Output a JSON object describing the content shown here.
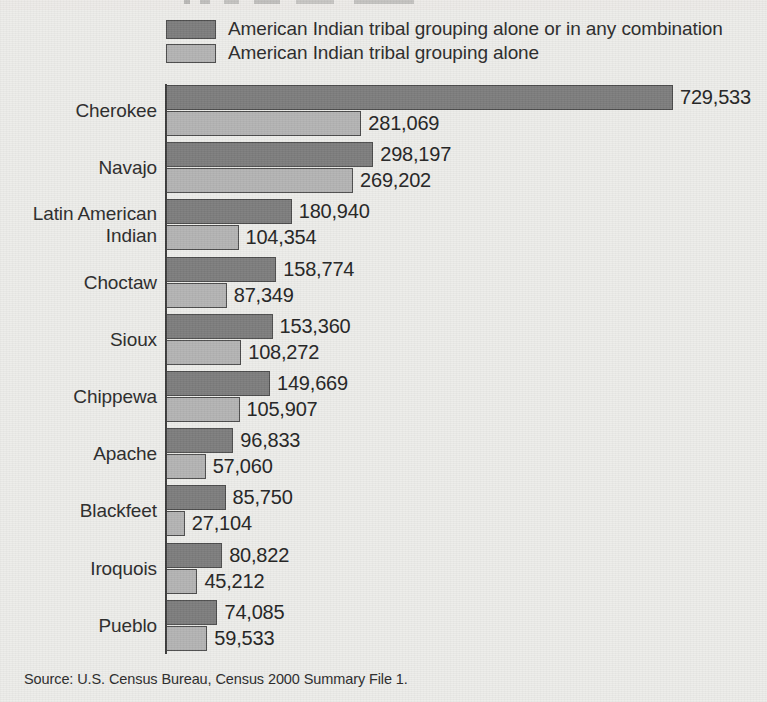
{
  "figure": {
    "background_color": "#ededea",
    "source_note": "Source: U.S. Census Bureau, Census 2000 Summary File 1."
  },
  "legend": {
    "items": [
      {
        "label": "American Indian tribal grouping alone or in any combination",
        "color": "#7d7d7d",
        "key": "combination"
      },
      {
        "label": "American Indian tribal grouping alone",
        "color": "#b4b4b4",
        "key": "alone"
      }
    ]
  },
  "chart_data": {
    "type": "bar",
    "orientation": "horizontal",
    "title": "",
    "xlabel": "",
    "ylabel": "",
    "grid": false,
    "legend_position": "top",
    "xlim": [
      0,
      729533
    ],
    "categories": [
      "Cherokee",
      "Latin American Indian",
      "Navajo",
      "Choctaw",
      "Sioux",
      "Chippewa",
      "Apache",
      "Blackfeet",
      "Iroquois",
      "Pueblo"
    ],
    "series": [
      {
        "name": "American Indian tribal grouping alone or in any combination",
        "color": "#7d7d7d",
        "values": [
          729533,
          298197,
          180940,
          158774,
          153360,
          149669,
          96833,
          85750,
          80822,
          74085
        ]
      },
      {
        "name": "American Indian tribal grouping alone",
        "color": "#b4b4b4",
        "values": [
          281069,
          269202,
          104354,
          87349,
          108272,
          105907,
          57060,
          27104,
          45212,
          59533
        ]
      }
    ],
    "groups": [
      {
        "category": "Cherokee",
        "label_lines": [
          "Cherokee"
        ],
        "combination": {
          "value": 729533,
          "label": "729,533"
        },
        "alone": {
          "value": 281069,
          "label": "281,069"
        }
      },
      {
        "category": "Navajo",
        "label_lines": [
          "Navajo"
        ],
        "combination": {
          "value": 298197,
          "label": "298,197"
        },
        "alone": {
          "value": 269202,
          "label": "269,202"
        }
      },
      {
        "category": "Latin American Indian",
        "label_lines": [
          "Latin American",
          "Indian"
        ],
        "combination": {
          "value": 180940,
          "label": "180,940"
        },
        "alone": {
          "value": 104354,
          "label": "104,354"
        }
      },
      {
        "category": "Choctaw",
        "label_lines": [
          "Choctaw"
        ],
        "combination": {
          "value": 158774,
          "label": "158,774"
        },
        "alone": {
          "value": 87349,
          "label": "87,349"
        }
      },
      {
        "category": "Sioux",
        "label_lines": [
          "Sioux"
        ],
        "combination": {
          "value": 153360,
          "label": "153,360"
        },
        "alone": {
          "value": 108272,
          "label": "108,272"
        }
      },
      {
        "category": "Chippewa",
        "label_lines": [
          "Chippewa"
        ],
        "combination": {
          "value": 149669,
          "label": "149,669"
        },
        "alone": {
          "value": 105907,
          "label": "105,907"
        }
      },
      {
        "category": "Apache",
        "label_lines": [
          "Apache"
        ],
        "combination": {
          "value": 96833,
          "label": "96,833"
        },
        "alone": {
          "value": 57060,
          "label": "57,060"
        }
      },
      {
        "category": "Blackfeet",
        "label_lines": [
          "Blackfeet"
        ],
        "combination": {
          "value": 85750,
          "label": "85,750"
        },
        "alone": {
          "value": 27104,
          "label": "27,104"
        }
      },
      {
        "category": "Iroquois",
        "label_lines": [
          "Iroquois"
        ],
        "combination": {
          "value": 80822,
          "label": "80,822"
        },
        "alone": {
          "value": 45212,
          "label": "45,212"
        }
      },
      {
        "category": "Pueblo",
        "label_lines": [
          "Pueblo"
        ],
        "combination": {
          "value": 74085,
          "label": "74,085"
        },
        "alone": {
          "value": 59533,
          "label": "59,533"
        }
      }
    ]
  }
}
